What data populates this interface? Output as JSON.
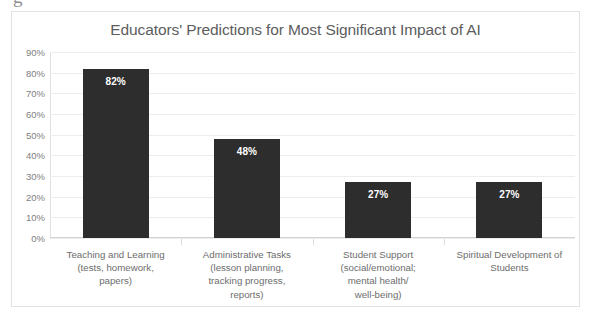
{
  "artifact": {
    "glyph": "g"
  },
  "chart_data": {
    "type": "bar",
    "title": "Educators' Predictions for Most Significant Impact of AI",
    "xlabel": "",
    "ylabel": "",
    "ylim": [
      0,
      90
    ],
    "grid": true,
    "legend": "none",
    "orientation": "vertical",
    "bar_color": "#2d2d2d",
    "value_label_color": "#ffffff",
    "title_color": "#5d5d5d",
    "gridline_color": "#ededed",
    "tick_label_color": "#808080",
    "y_ticks": [
      "0%",
      "10%",
      "20%",
      "30%",
      "40%",
      "50%",
      "60%",
      "70%",
      "80%",
      "90%"
    ],
    "y_tick_values": [
      0,
      10,
      20,
      30,
      40,
      50,
      60,
      70,
      80,
      90
    ],
    "categories": [
      "Teaching and Learning (tests, homework, papers)",
      "Administrative Tasks (lesson planning, tracking progress, reports)",
      "Student Support (social/emotional; mental health/ well-being)",
      "Spiritual Development of Students"
    ],
    "category_lines": [
      [
        "Teaching and Learning",
        "(tests, homework,",
        "papers)"
      ],
      [
        "Administrative Tasks",
        "(lesson planning,",
        "tracking progress,",
        "reports)"
      ],
      [
        "Student Support",
        "(social/emotional;",
        "mental health/",
        "well-being)"
      ],
      [
        "Spiritual Development of",
        "Students"
      ]
    ],
    "values": [
      82,
      48,
      27,
      27
    ],
    "value_labels": [
      "82%",
      "48%",
      "27%",
      "27%"
    ]
  }
}
